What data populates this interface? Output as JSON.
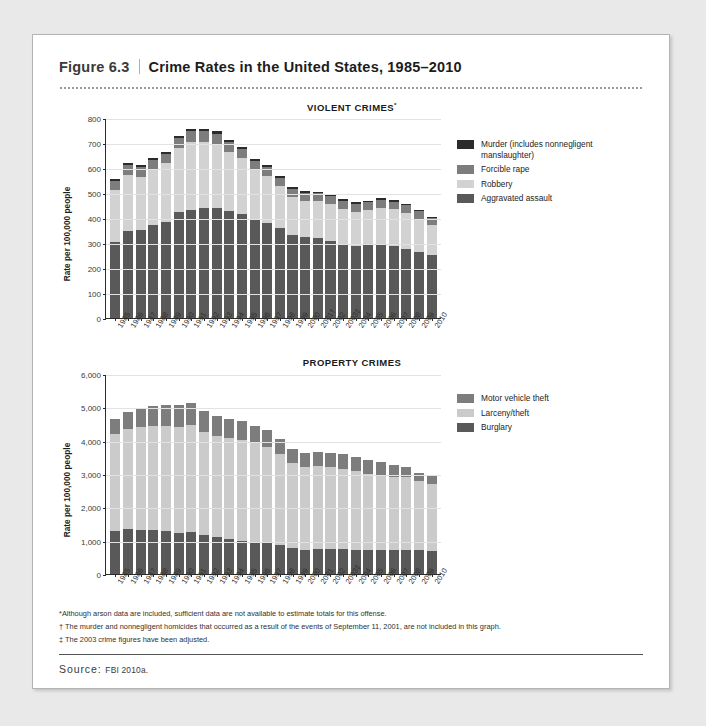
{
  "figure": {
    "number": "Figure 6.3",
    "title": "Crime Rates in the United States, 1985–2010"
  },
  "source": {
    "label": "Source: ",
    "value": "FBI 2010a."
  },
  "footnotes": [
    "*Although arson data are included, sufficient data are not available to estimate totals for this offense.",
    "† The murder and nonnegligent homicides that occurred as a result of the events of September 11, 2001, are not included in this graph.",
    "‡ The 2003 crime figures have been adjusted."
  ],
  "colors": {
    "murder": "#2b2b2b",
    "forcible_rape": "#7d7d7d",
    "robbery": "#d2d2d2",
    "aggravated_assault": "#595959",
    "motor_vehicle_theft": "#7d7d7d",
    "larceny_theft": "#cbcbcb",
    "burglary": "#595959",
    "axis": "#2b2b2b",
    "grid": "#e2e2e2",
    "card_background": "#ffffff",
    "page_background": "#e9e9e9"
  },
  "chart_data": [
    {
      "type": "bar",
      "stacked": true,
      "title": "VIOLENT CRIMES",
      "title_footnote": "*",
      "xlabel": "",
      "ylabel": "Rate per 100,000 people",
      "ylim": [
        0,
        800
      ],
      "yticks": [
        0,
        100,
        200,
        300,
        400,
        500,
        600,
        700,
        800
      ],
      "ytick_labels": [
        "0",
        "100",
        "200",
        "300",
        "400",
        "500",
        "600",
        "700",
        "800"
      ],
      "grid": true,
      "legend_position": "right",
      "categories": [
        "1985",
        "1986",
        "1987",
        "1988",
        "1989",
        "1990",
        "1991",
        "1992",
        "1993",
        "1994",
        "1995",
        "1996",
        "1997",
        "1998",
        "1999",
        "2000",
        "2001",
        "2002",
        "2003",
        "2004",
        "2005",
        "2006",
        "2007",
        "2008",
        "2009",
        "2010"
      ],
      "category_footnotes": {
        "2001": "†",
        "2003": "‡"
      },
      "series": [
        {
          "name": "Aggravated assault",
          "color": "#595959",
          "values": [
            303,
            347,
            352,
            372,
            385,
            423,
            433,
            442,
            440,
            427,
            418,
            391,
            382,
            361,
            334,
            324,
            319,
            310,
            295,
            289,
            291,
            292,
            287,
            277,
            265,
            253
          ]
        },
        {
          "name": "Robbery",
          "color": "#d2d2d2",
          "values": [
            209,
            226,
            213,
            221,
            234,
            257,
            273,
            264,
            256,
            238,
            221,
            202,
            186,
            166,
            150,
            145,
            149,
            146,
            142,
            137,
            141,
            150,
            148,
            145,
            133,
            119
          ]
        },
        {
          "name": "Forcible rape",
          "color": "#7d7d7d",
          "values": [
            37,
            38,
            38,
            38,
            38,
            41,
            42,
            43,
            41,
            39,
            37,
            36,
            36,
            34,
            33,
            32,
            32,
            33,
            32,
            32,
            32,
            31,
            30,
            30,
            29,
            28
          ]
        },
        {
          "name": "Murder (includes nonnegligent manslaughter)",
          "color": "#2b2b2b",
          "values": [
            8,
            9,
            8,
            8,
            9,
            9,
            10,
            9,
            10,
            9,
            8,
            7,
            7,
            6,
            6,
            6,
            6,
            6,
            6,
            5,
            6,
            6,
            6,
            5,
            5,
            5
          ]
        }
      ],
      "legend": [
        {
          "label": "Murder (includes nonnegligent manslaughter)",
          "color": "#2b2b2b"
        },
        {
          "label": "Forcible rape",
          "color": "#7d7d7d"
        },
        {
          "label": "Robbery",
          "color": "#d2d2d2"
        },
        {
          "label": "Aggravated assault",
          "color": "#595959"
        }
      ]
    },
    {
      "type": "bar",
      "stacked": true,
      "title": "PROPERTY CRIMES",
      "title_footnote": "",
      "xlabel": "",
      "ylabel": "Rate per 100,000 people",
      "ylim": [
        0,
        6000
      ],
      "yticks": [
        0,
        1000,
        2000,
        3000,
        4000,
        5000,
        6000
      ],
      "ytick_labels": [
        "0",
        "1,000",
        "2,000",
        "3,000",
        "4,000",
        "5,000",
        "6,000"
      ],
      "grid": true,
      "legend_position": "right",
      "categories": [
        "1985",
        "1986",
        "1987",
        "1988",
        "1989",
        "1990",
        "1991",
        "1992",
        "1993",
        "1994",
        "1995",
        "1996",
        "1997",
        "1998",
        "1999",
        "2000",
        "2001",
        "2002",
        "2003",
        "2004",
        "2005",
        "2006",
        "2007",
        "2008",
        "2009",
        "2010"
      ],
      "category_footnotes": {
        "2003": "‡"
      },
      "series": [
        {
          "name": "Burglary",
          "color": "#595959",
          "values": [
            1287,
            1345,
            1330,
            1309,
            1276,
            1232,
            1252,
            1168,
            1100,
            1042,
            987,
            945,
            919,
            863,
            770,
            729,
            741,
            747,
            741,
            730,
            727,
            733,
            726,
            733,
            717,
            700
          ]
        },
        {
          "name": "Larceny/theft",
          "color": "#cbcbcb",
          "values": [
            2901,
            3010,
            3081,
            3135,
            3171,
            3185,
            3229,
            3103,
            3034,
            3026,
            3043,
            2980,
            2892,
            2729,
            2551,
            2477,
            2486,
            2451,
            2417,
            2362,
            2287,
            2214,
            2185,
            2167,
            2064,
            2004
          ]
        },
        {
          "name": "Motor vehicle theft",
          "color": "#7d7d7d",
          "values": [
            463,
            508,
            529,
            583,
            630,
            656,
            659,
            632,
            606,
            591,
            561,
            526,
            506,
            460,
            422,
            412,
            431,
            433,
            433,
            422,
            417,
            400,
            364,
            315,
            259,
            239
          ]
        }
      ],
      "legend": [
        {
          "label": "Motor vehicle theft",
          "color": "#7d7d7d"
        },
        {
          "label": "Larceny/theft",
          "color": "#cbcbcb"
        },
        {
          "label": "Burglary",
          "color": "#595959"
        }
      ]
    }
  ]
}
